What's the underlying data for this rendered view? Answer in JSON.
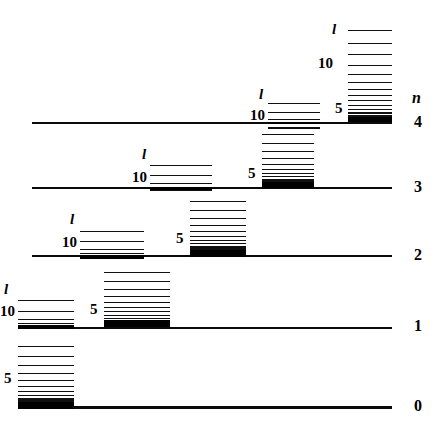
{
  "figure": {
    "width": 439,
    "height": 431,
    "background": "#ffffff",
    "ink": "#000000"
  },
  "axis": {
    "n_symbol": "n",
    "n_symbol_x": 412,
    "n_symbol_y": 90,
    "ticks": [
      {
        "label": "4",
        "x": 414,
        "y": 114
      },
      {
        "label": "3",
        "x": 414,
        "y": 179
      },
      {
        "label": "2",
        "x": 414,
        "y": 247
      },
      {
        "label": "1",
        "x": 414,
        "y": 318
      },
      {
        "label": "0",
        "x": 414,
        "y": 398
      }
    ]
  },
  "baselines": [
    {
      "n": 4,
      "x": 32,
      "y": 122,
      "width": 360,
      "height": 2
    },
    {
      "n": 3,
      "x": 32,
      "y": 187,
      "width": 360,
      "height": 2
    },
    {
      "n": 2,
      "x": 32,
      "y": 255,
      "width": 360,
      "height": 2
    },
    {
      "n": 1,
      "x": 32,
      "y": 327,
      "width": 360,
      "height": 2
    },
    {
      "n": 0,
      "x": 18,
      "y": 406,
      "width": 374,
      "height": 3
    }
  ],
  "ladders": [
    {
      "id": "n0-main",
      "n": 0,
      "x": 18,
      "width": 56,
      "base_y": 406,
      "rungs_y": [
        346,
        356,
        365,
        373,
        380,
        386,
        391,
        395,
        398,
        400,
        402
      ],
      "band": {
        "y": 402,
        "height": 7
      },
      "labels": [
        {
          "text": "5",
          "kind": "num",
          "x": 4,
          "y": 371
        }
      ]
    },
    {
      "id": "n1-left",
      "n": 1,
      "x": 18,
      "width": 56,
      "base_y": 327,
      "rungs_y": [
        300,
        311,
        319,
        323,
        325
      ],
      "band": {
        "y": 325,
        "height": 4
      },
      "labels": [
        {
          "text": "l",
          "kind": "l",
          "x": 4,
          "y": 282
        },
        {
          "text": "10",
          "kind": "num",
          "x": 0,
          "y": 304
        }
      ]
    },
    {
      "id": "n1-right",
      "n": 1,
      "x": 104,
      "width": 66,
      "base_y": 327,
      "rungs_y": [
        272,
        281,
        289,
        296,
        302,
        307,
        311,
        315,
        318,
        320,
        322,
        323
      ],
      "band": {
        "y": 320,
        "height": 7
      },
      "labels": [
        {
          "text": "5",
          "kind": "num",
          "x": 90,
          "y": 302
        }
      ]
    },
    {
      "id": "n2-left",
      "n": 2,
      "x": 80,
      "width": 64,
      "base_y": 255,
      "rungs_y": [
        231,
        241,
        249,
        253,
        255
      ],
      "band": {
        "y": 255,
        "height": 4
      },
      "labels": [
        {
          "text": "l",
          "kind": "l",
          "x": 70,
          "y": 212
        },
        {
          "text": "10",
          "kind": "num",
          "x": 62,
          "y": 235
        }
      ]
    },
    {
      "id": "n2-right",
      "n": 2,
      "x": 190,
      "width": 56,
      "base_y": 255,
      "rungs_y": [
        201,
        210,
        218,
        225,
        231,
        236,
        240,
        243,
        246,
        248,
        250
      ],
      "band": {
        "y": 250,
        "height": 7
      },
      "labels": [
        {
          "text": "5",
          "kind": "num",
          "x": 176,
          "y": 231
        }
      ]
    },
    {
      "id": "n3-left",
      "n": 3,
      "x": 150,
      "width": 62,
      "base_y": 187,
      "rungs_y": [
        165,
        175,
        183,
        187,
        189
      ],
      "band": {
        "y": 187,
        "height": 3
      },
      "labels": [
        {
          "text": "l",
          "kind": "l",
          "x": 142,
          "y": 147
        },
        {
          "text": "10",
          "kind": "num",
          "x": 132,
          "y": 170
        }
      ]
    },
    {
      "id": "n3-right",
      "n": 3,
      "x": 262,
      "width": 52,
      "base_y": 187,
      "rungs_y": [
        134,
        143,
        151,
        158,
        164,
        169,
        173,
        176,
        179,
        181,
        182
      ],
      "band": {
        "y": 182,
        "height": 6
      },
      "labels": [
        {
          "text": "5",
          "kind": "num",
          "x": 248,
          "y": 166
        }
      ]
    },
    {
      "id": "n4-left",
      "n": 4,
      "x": 268,
      "width": 52,
      "base_y": 122,
      "rungs_y": [
        103,
        112,
        119,
        122,
        127
      ],
      "band": {
        "y": 122,
        "height": 2
      },
      "labels": [
        {
          "text": "l",
          "kind": "l",
          "x": 259,
          "y": 87
        },
        {
          "text": "10",
          "kind": "num",
          "x": 250,
          "y": 108
        }
      ]
    },
    {
      "id": "n4-right",
      "n": 4,
      "x": 348,
      "width": 44,
      "base_y": 122,
      "rungs_y": [
        30,
        43,
        54,
        65,
        74,
        82,
        89,
        95,
        100,
        105,
        109,
        112,
        115,
        117,
        119
      ],
      "band": {
        "y": 117,
        "height": 5
      },
      "labels": [
        {
          "text": "l",
          "kind": "l",
          "x": 332,
          "y": 22
        },
        {
          "text": "10",
          "kind": "num",
          "x": 318,
          "y": 56
        },
        {
          "text": "5",
          "kind": "num",
          "x": 335,
          "y": 101
        }
      ]
    }
  ]
}
